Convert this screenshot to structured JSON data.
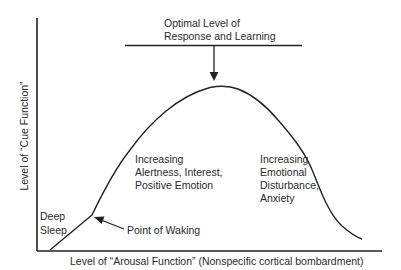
{
  "diagram": {
    "type": "inverted-u-curve",
    "top_annotation": {
      "line1": "Optimal Level of",
      "line2": "Response and Learning"
    },
    "axes": {
      "y_label": "Level of “Cue Function”",
      "x_label": "Level of “Arousal Function” (Nonspecific cortical bombardment)"
    },
    "regions": {
      "left_low": {
        "line1": "Deep",
        "line2": "Sleep"
      },
      "waking": "Point of Waking",
      "rising": {
        "line1": "Increasing",
        "line2": "Alertness, Interest,",
        "line3": "Positive Emotion"
      },
      "falling": {
        "line1": "Increasing",
        "line2": "Emotional",
        "line3": "Disturbance,",
        "line4": "Anxiety"
      }
    },
    "colors": {
      "line": "#222222",
      "text": "#2a2a2a",
      "background": "#ffffff"
    }
  }
}
